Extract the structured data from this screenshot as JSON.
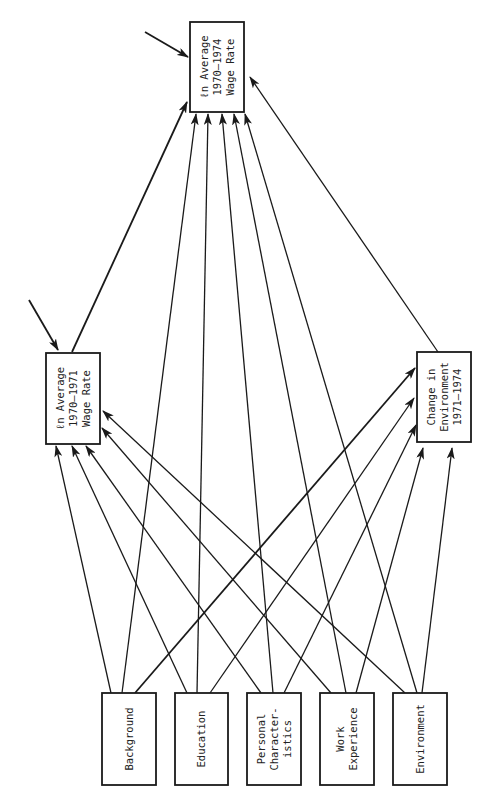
{
  "diagram": {
    "type": "path-diagram",
    "orientation": "rotated-90-ccw",
    "stroke_color": "#1a1a1a",
    "nodes": [
      {
        "id": "top",
        "lines": [
          "ℓn Average",
          "1970–1974",
          "Wage Rate"
        ],
        "x": 190,
        "y": 22,
        "w": 54,
        "h": 90
      },
      {
        "id": "left",
        "lines": [
          "ℓn Average",
          "1970–1971",
          "Wage Rate"
        ],
        "x": 46,
        "y": 353,
        "w": 54,
        "h": 91
      },
      {
        "id": "change",
        "lines": [
          "Change in",
          "Environment",
          "1971–1974"
        ],
        "x": 417,
        "y": 352,
        "w": 54,
        "h": 90
      },
      {
        "id": "background",
        "lines": [
          "Background"
        ],
        "x": 102,
        "y": 693,
        "w": 54,
        "h": 92
      },
      {
        "id": "education",
        "lines": [
          "Education"
        ],
        "x": 175,
        "y": 693,
        "w": 53,
        "h": 92
      },
      {
        "id": "personal",
        "lines": [
          "Personal",
          "Character-",
          "istics"
        ],
        "x": 247,
        "y": 693,
        "w": 54,
        "h": 92
      },
      {
        "id": "work",
        "lines": [
          "Work",
          "Experience"
        ],
        "x": 320,
        "y": 693,
        "w": 54,
        "h": 92
      },
      {
        "id": "environment",
        "lines": [
          "Environment"
        ],
        "x": 393,
        "y": 693,
        "w": 54,
        "h": 92
      }
    ],
    "edges": [
      {
        "from": "error",
        "to": "top",
        "x1": 145,
        "y1": 32,
        "x2": 188,
        "y2": 57,
        "thick": true
      },
      {
        "from": "error",
        "to": "left",
        "x1": 29,
        "y1": 300,
        "x2": 58,
        "y2": 350,
        "thick": true
      },
      {
        "from": "left",
        "to": "top",
        "x1": 72,
        "y1": 352,
        "x2": 187,
        "y2": 102,
        "thick": true
      },
      {
        "from": "change",
        "to": "top",
        "x1": 438,
        "y1": 352,
        "x2": 250,
        "y2": 77,
        "thick": false
      },
      {
        "from": "background",
        "to": "left",
        "x1": 111,
        "y1": 693,
        "x2": 56,
        "y2": 446,
        "thick": false
      },
      {
        "from": "background",
        "to": "top",
        "x1": 122,
        "y1": 693,
        "x2": 196,
        "y2": 114,
        "thick": false
      },
      {
        "from": "background",
        "to": "change",
        "x1": 135,
        "y1": 693,
        "x2": 415,
        "y2": 368,
        "thick": true
      },
      {
        "from": "education",
        "to": "left",
        "x1": 187,
        "y1": 693,
        "x2": 72,
        "y2": 446,
        "thick": false
      },
      {
        "from": "education",
        "to": "top",
        "x1": 197,
        "y1": 693,
        "x2": 208,
        "y2": 114,
        "thick": false
      },
      {
        "from": "education",
        "to": "change",
        "x1": 210,
        "y1": 693,
        "x2": 414,
        "y2": 398,
        "thick": false
      },
      {
        "from": "personal",
        "to": "left",
        "x1": 261,
        "y1": 693,
        "x2": 86,
        "y2": 446,
        "thick": false
      },
      {
        "from": "personal",
        "to": "top",
        "x1": 273,
        "y1": 693,
        "x2": 222,
        "y2": 114,
        "thick": false
      },
      {
        "from": "personal",
        "to": "change",
        "x1": 284,
        "y1": 693,
        "x2": 416,
        "y2": 425,
        "thick": false
      },
      {
        "from": "work",
        "to": "left",
        "x1": 331,
        "y1": 693,
        "x2": 102,
        "y2": 428,
        "thick": false
      },
      {
        "from": "work",
        "to": "top",
        "x1": 346,
        "y1": 693,
        "x2": 234,
        "y2": 114,
        "thick": false
      },
      {
        "from": "work",
        "to": "change",
        "x1": 356,
        "y1": 693,
        "x2": 423,
        "y2": 448,
        "thick": false
      },
      {
        "from": "environment",
        "to": "left",
        "x1": 405,
        "y1": 693,
        "x2": 103,
        "y2": 411,
        "thick": false
      },
      {
        "from": "environment",
        "to": "top",
        "x1": 417,
        "y1": 693,
        "x2": 245,
        "y2": 114,
        "thick": false
      },
      {
        "from": "environment",
        "to": "change",
        "x1": 422,
        "y1": 693,
        "x2": 452,
        "y2": 448,
        "thick": false
      }
    ]
  }
}
